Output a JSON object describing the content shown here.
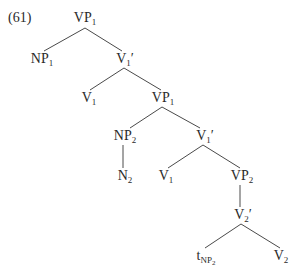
{
  "example_number": "(61)",
  "nodes": {
    "root": {
      "cat": "VP",
      "sub": "1",
      "prime": ""
    },
    "np1": {
      "cat": "NP",
      "sub": "1",
      "prime": ""
    },
    "v1bar_a": {
      "cat": "V",
      "sub": "1",
      "prime": "′"
    },
    "v1_a": {
      "cat": "V",
      "sub": "1",
      "prime": ""
    },
    "vp1_b": {
      "cat": "VP",
      "sub": "1",
      "prime": ""
    },
    "np2": {
      "cat": "NP",
      "sub": "2",
      "prime": ""
    },
    "v1bar_b": {
      "cat": "V",
      "sub": "1",
      "prime": "′"
    },
    "n2": {
      "cat": "N",
      "sub": "2",
      "prime": ""
    },
    "v1_b": {
      "cat": "V",
      "sub": "1",
      "prime": ""
    },
    "vp2": {
      "cat": "VP",
      "sub": "2",
      "prime": ""
    },
    "v2bar": {
      "cat": "V",
      "sub": "2",
      "prime": "′"
    },
    "trace": {
      "cat": "t",
      "sub": "NP",
      "subsub": "2",
      "prime": ""
    },
    "v2": {
      "cat": "V",
      "sub": "2",
      "prime": ""
    }
  },
  "edges": [
    [
      "root",
      "np1"
    ],
    [
      "root",
      "v1bar_a"
    ],
    [
      "v1bar_a",
      "v1_a"
    ],
    [
      "v1bar_a",
      "vp1_b"
    ],
    [
      "vp1_b",
      "np2"
    ],
    [
      "vp1_b",
      "v1bar_b"
    ],
    [
      "np2",
      "n2"
    ],
    [
      "v1bar_b",
      "v1_b"
    ],
    [
      "v1bar_b",
      "vp2"
    ],
    [
      "vp2",
      "v2bar"
    ],
    [
      "v2bar",
      "trace"
    ],
    [
      "v2bar",
      "v2"
    ]
  ]
}
